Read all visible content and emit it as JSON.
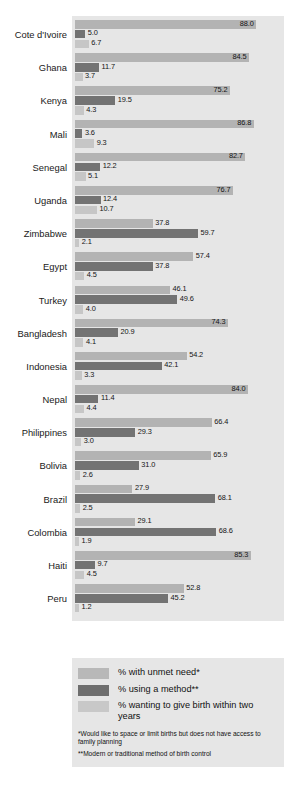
{
  "chart_data": {
    "type": "bar",
    "orientation": "horizontal",
    "title": "",
    "xlabel": "",
    "ylabel": "",
    "xlim": [
      0,
      100
    ],
    "grid": false,
    "legend_position": "bottom",
    "categories": [
      "Cote d'Ivoire",
      "Ghana",
      "Kenya",
      "Mali",
      "Senegal",
      "Uganda",
      "Zimbabwe",
      "Egypt",
      "Turkey",
      "Bangladesh",
      "Indonesia",
      "Nepal",
      "Philippines",
      "Bolivia",
      "Brazil",
      "Colombia",
      "Haiti",
      "Peru"
    ],
    "series": [
      {
        "name": "% with unmet need*",
        "color": "#b3b3b3",
        "values": [
          88.0,
          84.5,
          75.2,
          86.8,
          82.7,
          76.7,
          37.8,
          57.4,
          46.1,
          74.3,
          54.2,
          84.0,
          66.4,
          65.9,
          27.9,
          29.1,
          85.3,
          52.8
        ]
      },
      {
        "name": "% using a method**",
        "color": "#737373",
        "values": [
          5.0,
          11.7,
          19.5,
          3.6,
          12.2,
          12.4,
          59.7,
          37.8,
          49.6,
          20.9,
          42.1,
          11.4,
          29.3,
          31.0,
          68.1,
          68.6,
          9.7,
          45.2
        ]
      },
      {
        "name": "% wanting to give birth within two years",
        "color": "#c6c6c6",
        "values": [
          6.7,
          3.7,
          4.3,
          9.3,
          5.1,
          10.7,
          2.1,
          4.5,
          4.0,
          4.1,
          3.3,
          4.4,
          3.0,
          2.6,
          2.5,
          1.9,
          4.5,
          1.2
        ]
      }
    ]
  },
  "legend": {
    "items": [
      {
        "label": "% with unmet need*",
        "swatch": "s0"
      },
      {
        "label": "% using a method**",
        "swatch": "s1"
      },
      {
        "label": "% wanting to give birth within two years",
        "swatch": "s2"
      }
    ],
    "notes": [
      "*Would like to space or limit births but does not have access to family planning",
      "**Modern or traditional method of birth control"
    ]
  }
}
